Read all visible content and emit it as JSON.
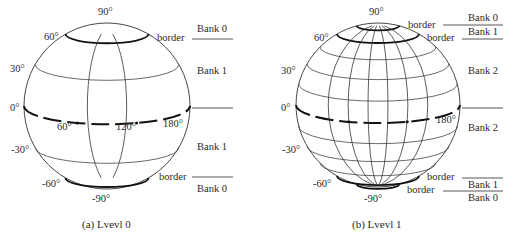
{
  "figures": [
    {
      "id": "a",
      "caption": "(a) Lvevl 0",
      "latitude_labels": [
        "90°",
        "60°",
        "30°",
        "0°",
        "-30°",
        "-60°",
        "-90°"
      ],
      "longitude_labels": [
        "60°",
        "120°",
        "180°"
      ],
      "border_labels": [
        "border",
        "border"
      ],
      "bank_labels": [
        "Bank 0",
        "Bank 1",
        "Bank 1",
        "Bank 0"
      ],
      "meridian_count": 2,
      "parallels_deg": [
        60,
        30,
        -30,
        -60
      ],
      "border_parallels_deg": [
        60,
        -60
      ]
    },
    {
      "id": "b",
      "caption": "(b) Lvevl 1",
      "latitude_labels": [
        "90°",
        "60°",
        "30°",
        "0°",
        "-30°",
        "-60°",
        "-90°"
      ],
      "longitude_labels": [
        "180°"
      ],
      "border_labels": [
        "border",
        "border",
        "border",
        "border"
      ],
      "bank_labels": [
        "Bank 0",
        "Bank 1",
        "Bank 2",
        "Bank 2",
        "Bank 1",
        "Bank 0"
      ],
      "meridian_count": 6,
      "parallels_deg": [
        75,
        60,
        45,
        30,
        15,
        -15,
        -30,
        -45,
        -60,
        -75
      ],
      "border_parallels_deg": [
        75,
        60,
        -60,
        -75
      ]
    }
  ]
}
